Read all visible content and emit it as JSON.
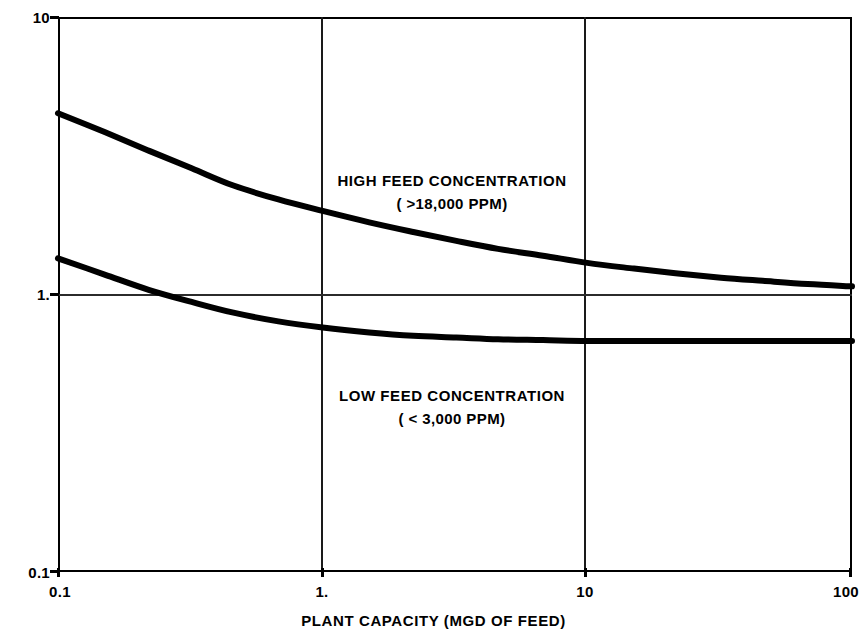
{
  "chart_data": {
    "type": "line",
    "title": "",
    "xlabel": "PLANT CAPACITY (MGD OF FEED)",
    "ylabel": "PURCHASE PRICE ($/GPD OF FEED )",
    "xscale": "log",
    "yscale": "log",
    "xlim": [
      0.1,
      100
    ],
    "ylim": [
      0.1,
      10
    ],
    "grid": true,
    "legend_position": "inline-annotation",
    "xticks": [
      {
        "value": 0.1,
        "label": "0.1"
      },
      {
        "value": 1,
        "label": "1."
      },
      {
        "value": 10,
        "label": "10"
      },
      {
        "value": 100,
        "label": "100"
      }
    ],
    "yticks": [
      {
        "value": 0.1,
        "label": "0.1"
      },
      {
        "value": 1,
        "label": "1."
      },
      {
        "value": 10,
        "label": "10"
      }
    ],
    "gridlines_x": [
      1,
      10
    ],
    "gridlines_y": [
      1
    ],
    "series": [
      {
        "name": "HIGH FEED CONCENTRATION",
        "sublabel": "( >18,000 PPM)",
        "color": "#000000",
        "x": [
          0.1,
          0.15,
          0.22,
          0.32,
          0.46,
          0.68,
          1.0,
          1.5,
          2.2,
          3.2,
          4.6,
          6.8,
          10.0,
          15.0,
          22.0,
          32.0,
          46.0,
          68.0,
          100.0
        ],
        "y": [
          4.5,
          3.85,
          3.3,
          2.85,
          2.47,
          2.2,
          2.0,
          1.82,
          1.68,
          1.56,
          1.46,
          1.38,
          1.3,
          1.24,
          1.19,
          1.15,
          1.12,
          1.09,
          1.07
        ]
      },
      {
        "name": "LOW FEED CONCENTRATION",
        "sublabel": "( < 3,000 PPM)",
        "color": "#000000",
        "x": [
          0.1,
          0.15,
          0.22,
          0.32,
          0.46,
          0.68,
          1.0,
          1.5,
          2.2,
          3.2,
          4.6,
          6.8,
          10.0,
          15.0,
          22.0,
          32.0,
          46.0,
          68.0,
          100.0
        ],
        "y": [
          1.35,
          1.18,
          1.04,
          0.94,
          0.86,
          0.8,
          0.76,
          0.73,
          0.71,
          0.7,
          0.69,
          0.685,
          0.68,
          0.68,
          0.68,
          0.68,
          0.68,
          0.68,
          0.68
        ]
      }
    ],
    "annotations": [
      {
        "text": "HIGH FEED CONCENTRATION",
        "sub": "( >18,000 PPM)",
        "x": 1.9,
        "y": 2.9
      },
      {
        "text": "LOW FEED CONCENTRATION",
        "sub": "( < 3,000 PPM)",
        "x": 1.9,
        "y": 0.46
      }
    ]
  },
  "axes": {
    "x_title": "PLANT CAPACITY (MGD OF FEED)",
    "y_title": "PURCHASE PRICE ($/GPD OF FEED )",
    "x_tick_labels": [
      "0.1",
      "1.",
      "10",
      "100"
    ],
    "y_tick_labels": [
      "10",
      "1.",
      "0.1"
    ]
  },
  "annotations": {
    "high": {
      "line1": "HIGH FEED CONCENTRATION",
      "line2": "( >18,000 PPM)"
    },
    "low": {
      "line1": "LOW FEED CONCENTRATION",
      "line2": "( < 3,000 PPM)"
    }
  },
  "colors": {
    "curve": "#000000",
    "frame": "#000000",
    "grid": "#2b2b2b",
    "background": "#ffffff"
  }
}
